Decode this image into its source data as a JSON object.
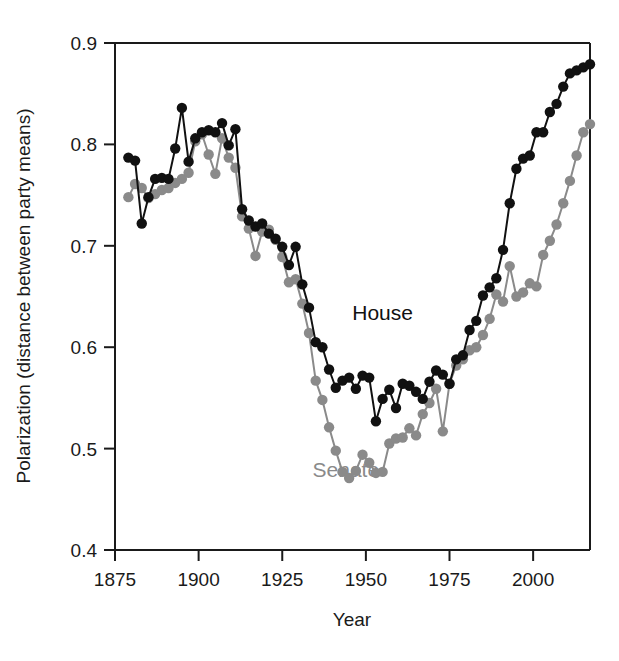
{
  "chart_data": {
    "type": "line",
    "title": "",
    "xlabel": "Year",
    "ylabel": "Polarization (distance between party means)",
    "xlim": [
      1875,
      2017
    ],
    "ylim": [
      0.4,
      0.9
    ],
    "xticks": [
      "1875",
      "1900",
      "1925",
      "1950",
      "1975",
      "2000"
    ],
    "xtick_values": [
      1875,
      1900,
      1925,
      1950,
      1975,
      2000
    ],
    "yticks": [
      "0.4",
      "0.5",
      "0.6",
      "0.7",
      "0.8",
      "0.9"
    ],
    "ytick_values": [
      0.4,
      0.5,
      0.6,
      0.7,
      0.8,
      0.9
    ],
    "grid": false,
    "legend_position": "inline-annotation",
    "markers": "filled-circle",
    "series": [
      {
        "name": "House",
        "color": "#111111",
        "label_x": 1955,
        "label_y": 0.627,
        "x": [
          1879,
          1881,
          1883,
          1885,
          1887,
          1889,
          1891,
          1893,
          1895,
          1897,
          1899,
          1901,
          1903,
          1905,
          1907,
          1909,
          1911,
          1913,
          1915,
          1917,
          1919,
          1921,
          1923,
          1925,
          1927,
          1929,
          1931,
          1933,
          1935,
          1937,
          1939,
          1941,
          1943,
          1945,
          1947,
          1949,
          1951,
          1953,
          1955,
          1957,
          1959,
          1961,
          1963,
          1965,
          1967,
          1969,
          1971,
          1973,
          1975,
          1977,
          1979,
          1981,
          1983,
          1985,
          1987,
          1989,
          1991,
          1993,
          1995,
          1997,
          1999,
          2001,
          2003,
          2005,
          2007,
          2009,
          2011,
          2013,
          2015,
          2017
        ],
        "y": [
          0.787,
          0.784,
          0.722,
          0.748,
          0.766,
          0.767,
          0.766,
          0.796,
          0.836,
          0.783,
          0.806,
          0.812,
          0.814,
          0.812,
          0.821,
          0.799,
          0.815,
          0.736,
          0.725,
          0.719,
          0.722,
          0.712,
          0.707,
          0.699,
          0.681,
          0.699,
          0.662,
          0.639,
          0.605,
          0.6,
          0.578,
          0.56,
          0.567,
          0.57,
          0.559,
          0.572,
          0.57,
          0.527,
          0.549,
          0.558,
          0.54,
          0.564,
          0.562,
          0.556,
          0.549,
          0.566,
          0.577,
          0.573,
          0.564,
          0.588,
          0.592,
          0.617,
          0.626,
          0.651,
          0.659,
          0.668,
          0.696,
          0.742,
          0.776,
          0.786,
          0.789,
          0.812,
          0.812,
          0.832,
          0.84,
          0.857,
          0.87,
          0.873,
          0.876,
          0.879
        ]
      },
      {
        "name": "Senate",
        "color": "#8a8a8a",
        "label_x": 1944,
        "label_y": 0.472,
        "x": [
          1879,
          1881,
          1883,
          1885,
          1887,
          1889,
          1891,
          1893,
          1895,
          1897,
          1899,
          1901,
          1903,
          1905,
          1907,
          1909,
          1911,
          1913,
          1915,
          1917,
          1919,
          1921,
          1923,
          1925,
          1927,
          1929,
          1931,
          1933,
          1935,
          1937,
          1939,
          1941,
          1943,
          1945,
          1947,
          1949,
          1951,
          1953,
          1955,
          1957,
          1959,
          1961,
          1963,
          1965,
          1967,
          1969,
          1971,
          1973,
          1975,
          1977,
          1979,
          1981,
          1983,
          1985,
          1987,
          1989,
          1991,
          1993,
          1995,
          1997,
          1999,
          2001,
          2003,
          2005,
          2007,
          2009,
          2011,
          2013,
          2015,
          2017
        ],
        "y": [
          0.748,
          0.761,
          0.757,
          0.747,
          0.751,
          0.755,
          0.757,
          0.762,
          0.766,
          0.772,
          0.803,
          0.81,
          0.79,
          0.771,
          0.806,
          0.787,
          0.777,
          0.729,
          0.717,
          0.69,
          0.714,
          0.716,
          0.706,
          0.689,
          0.664,
          0.667,
          0.643,
          0.614,
          0.567,
          0.548,
          0.521,
          0.498,
          0.477,
          0.471,
          0.478,
          0.494,
          0.486,
          0.476,
          0.477,
          0.505,
          0.51,
          0.511,
          0.52,
          0.513,
          0.534,
          0.545,
          0.559,
          0.517,
          0.564,
          0.582,
          0.588,
          0.597,
          0.6,
          0.612,
          0.628,
          0.652,
          0.645,
          0.68,
          0.65,
          0.654,
          0.663,
          0.66,
          0.691,
          0.705,
          0.721,
          0.742,
          0.764,
          0.789,
          0.812,
          0.82
        ]
      }
    ]
  },
  "axes": {
    "x_title": "Year",
    "y_title": "Polarization (distance between party means)"
  }
}
